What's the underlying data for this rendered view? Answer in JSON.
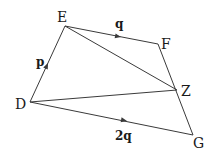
{
  "diagram": {
    "type": "vector-geometry",
    "points": {
      "D": {
        "label": "D",
        "x": 30,
        "y": 102
      },
      "E": {
        "label": "E",
        "x": 65,
        "y": 26
      },
      "F": {
        "label": "F",
        "x": 158,
        "y": 44
      },
      "Z": {
        "label": "Z",
        "x": 177,
        "y": 90
      },
      "G": {
        "label": "G",
        "x": 193,
        "y": 135
      }
    },
    "edges": [
      {
        "from": "D",
        "to": "E",
        "vector_label": "p",
        "arrow": true
      },
      {
        "from": "E",
        "to": "F",
        "vector_label": "q",
        "arrow": true
      },
      {
        "from": "D",
        "to": "G",
        "vector_label": "2q",
        "arrow": true
      },
      {
        "from": "F",
        "to": "G",
        "arrow": false
      },
      {
        "from": "E",
        "to": "Z",
        "arrow": false
      },
      {
        "from": "D",
        "to": "Z",
        "arrow": false
      }
    ],
    "labels": {
      "D": "D",
      "E": "E",
      "F": "F",
      "Z": "Z",
      "G": "G",
      "p": "p",
      "q": "q",
      "two_q": "2q"
    },
    "colors": {
      "line": "#3a3a3a",
      "text": "#1a1a1a",
      "background": "#ffffff"
    }
  }
}
